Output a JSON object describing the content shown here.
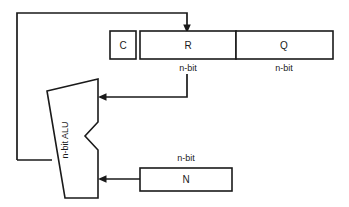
{
  "diagram": {
    "colors": {
      "stroke": "#1a1a1a",
      "fill": "#ffffff",
      "background": "#ffffff"
    },
    "blocks": {
      "carry": {
        "label": "C",
        "name": "carry-flag-box"
      },
      "r_register": {
        "label": "R",
        "width_label": "n-bit",
        "name": "r-register-box"
      },
      "q_register": {
        "label": "Q",
        "width_label": "n-bit",
        "name": "q-register-box"
      },
      "n_register": {
        "label": "N",
        "width_label": "n-bit",
        "name": "n-register-box"
      },
      "alu": {
        "label": "n-bit ALU",
        "name": "alu-block"
      }
    },
    "wires": {
      "feedback": {
        "name": "alu-to-r-feedback-wire",
        "from": "n-bit ALU",
        "to": "R"
      },
      "r_to_alu": {
        "name": "r-to-alu-wire",
        "from": "R",
        "to": "n-bit ALU"
      },
      "n_to_alu": {
        "name": "n-to-alu-wire",
        "from": "N",
        "to": "n-bit ALU"
      }
    }
  }
}
